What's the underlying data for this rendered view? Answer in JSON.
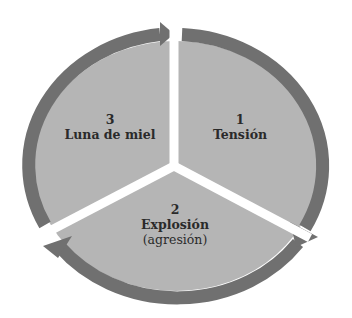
{
  "diagram": {
    "type": "cycle",
    "colors": {
      "ring": "#707070",
      "fill": "#b5b5b5",
      "gap": "#ffffff",
      "text": "#2a2a2a"
    },
    "phases": [
      {
        "number": "1",
        "name": "Tensión",
        "sub": ""
      },
      {
        "number": "2",
        "name": "Explosión",
        "sub": "(agresión)"
      },
      {
        "number": "3",
        "name": "Luna de miel",
        "sub": ""
      }
    ],
    "flow": [
      "1 → 2",
      "2 → 3",
      "3 → 1"
    ],
    "direction": "clockwise"
  }
}
